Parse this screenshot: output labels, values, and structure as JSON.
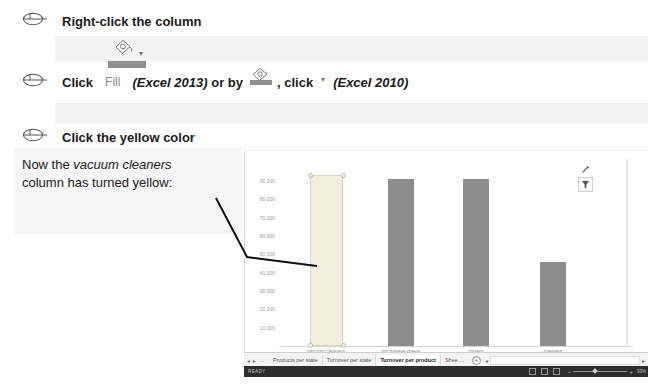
{
  "steps": {
    "step1": "Right-click the column",
    "step2": {
      "click": "Click",
      "fill": "Fill",
      "excel2013": "(Excel 2013)",
      "or_by": " or by",
      "comma_click": ", click",
      "excel2010": "(Excel 2010)"
    },
    "step3": "Click the yellow color"
  },
  "note": {
    "prefix": "Now the ",
    "product": "vacuum cleaners",
    "line2": "column has turned yellow:"
  },
  "icons": {
    "dropdown_glyph": "▾",
    "nav_left_glyph": "◂",
    "nav_right_glyph": "▸",
    "ellipsis_glyph": "...",
    "new_sheet_glyph": "+",
    "scroll_left_glyph": "◂",
    "scroll_right_glyph": "▸",
    "zoom_minus_glyph": "−",
    "zoom_plus_glyph": "+"
  },
  "chart_data": {
    "type": "bar",
    "title": "",
    "xlabel": "",
    "ylabel": "",
    "categories": [
      "vacuum cleaners",
      "microwave ovens",
      "mixers",
      "toasters"
    ],
    "values": [
      93000,
      91000,
      91000,
      46000
    ],
    "selected_index": 0,
    "selected_fill": "#f1eedb",
    "selected_border": "#d9d5b9",
    "bar_fill": "#8d8d8d",
    "ylim": [
      0,
      95000
    ],
    "yticks": [
      90000,
      80000,
      70000,
      60000,
      50000,
      40000,
      30000,
      20000,
      10000,
      0
    ],
    "ytick_labels": [
      "90,000",
      "80,000",
      "70,000",
      "60,000",
      "50,000",
      "40,000",
      "30,000",
      "20,000",
      "10,000",
      "-"
    ],
    "grid": false,
    "legend": false
  },
  "sheet_bar": {
    "tabs": [
      {
        "label": "Products per state",
        "active": false
      },
      {
        "label": "Turnover per state",
        "active": false
      },
      {
        "label": "Turnover per product",
        "active": true
      },
      {
        "label": "Shee ...",
        "active": false
      }
    ]
  },
  "status_bar": {
    "ready": "READY",
    "zoom": "93%"
  },
  "colors": {
    "fill_bar": "#8f8f8f",
    "status_bg": "#2d2d2d",
    "strip_bg": "#f4f4f4"
  }
}
